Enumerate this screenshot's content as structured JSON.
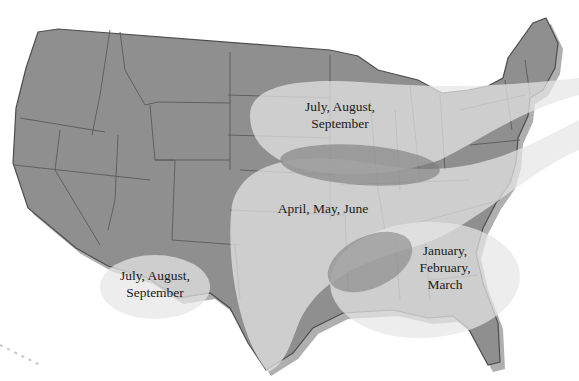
{
  "map": {
    "subject": "Contiguous United States",
    "colors": {
      "land": "#8f8f8f",
      "state_border": "#5a5a5a",
      "coast_shadow": "#6e6e6e",
      "region_fill": "#e4e4e4",
      "overlap_fill": "#7e7e7e",
      "background": "#ffffff",
      "label_text": "#1a1a1a"
    },
    "regions": [
      {
        "id": "northern-plains-great-lakes",
        "season_lines": [
          "July, August,",
          "September"
        ],
        "area": "Upper Midwest band extending east to New England"
      },
      {
        "id": "central-south-plains",
        "season_lines": [
          "April, May, June"
        ],
        "area": "Southern & central plains, Texas to Ohio Valley"
      },
      {
        "id": "southeast",
        "season_lines": [
          "January,",
          "February,",
          "March"
        ],
        "area": "Gulf Coast and Southeast"
      },
      {
        "id": "southwest",
        "season_lines": [
          "July, August,",
          "September"
        ],
        "area": "Arizona / New Mexico border"
      }
    ]
  }
}
